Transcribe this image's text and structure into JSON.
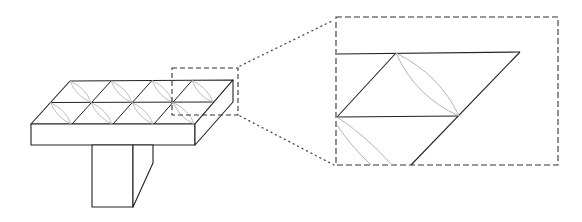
{
  "figure": {
    "colors": {
      "outline": "#222222",
      "ellipse": "#b5b5b5",
      "dashed_box": "#333333",
      "dotted_connector": "#444444",
      "background": "#ffffff"
    },
    "grid": {
      "columns": 4,
      "rows": 2
    },
    "zoom_region": {
      "label": ""
    },
    "magnified_view": {
      "label": ""
    }
  }
}
